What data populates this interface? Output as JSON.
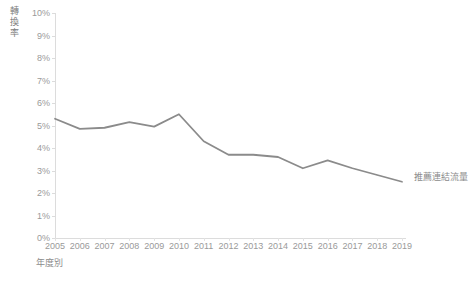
{
  "chart_data": {
    "type": "line",
    "title": "",
    "subtitle": "",
    "xlabel": "年度別",
    "ylabel": "轉換率",
    "categories": [
      "2005",
      "2006",
      "2007",
      "2008",
      "2009",
      "2010",
      "2011",
      "2012",
      "2013",
      "2014",
      "2015",
      "2016",
      "2017",
      "2018",
      "2019"
    ],
    "series": [
      {
        "name": "推薦連結流量",
        "values": [
          5.3,
          4.85,
          4.9,
          5.15,
          4.95,
          5.5,
          4.3,
          3.7,
          3.7,
          3.6,
          3.1,
          3.45,
          3.1,
          2.8,
          2.5
        ],
        "color": "#8b8b8b",
        "label_position": "right-end"
      }
    ],
    "ylim": [
      0,
      10
    ],
    "ytick_values": [
      0,
      1,
      2,
      3,
      4,
      5,
      6,
      7,
      8,
      9,
      10
    ],
    "ytick_labels": [
      "0%",
      "1%",
      "2%",
      "3%",
      "4%",
      "5%",
      "6%",
      "7%",
      "8%",
      "9%",
      "10%"
    ],
    "grid": false,
    "legend": "inline-end-label",
    "axis_color": "#dcdcdc",
    "text_color": "#9a9a9a"
  },
  "axes": {
    "y_title_chars": [
      "轉",
      "換",
      "率"
    ],
    "x_title": "年度別"
  }
}
